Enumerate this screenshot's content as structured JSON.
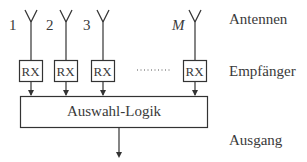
{
  "diagram": {
    "type": "antenna-selection-diversity",
    "antennas": [
      {
        "label": "1"
      },
      {
        "label": "2"
      },
      {
        "label": "3"
      },
      {
        "label": "M"
      }
    ],
    "receiver_label": "RX",
    "ellipsis": ".......",
    "logic_label": "Auswahl-Logik",
    "row_labels": {
      "antennas": "Antennen",
      "receivers": "Empfänger",
      "output": "Ausgang"
    },
    "colors": {
      "stroke": "#333333",
      "background": "#ffffff"
    }
  }
}
